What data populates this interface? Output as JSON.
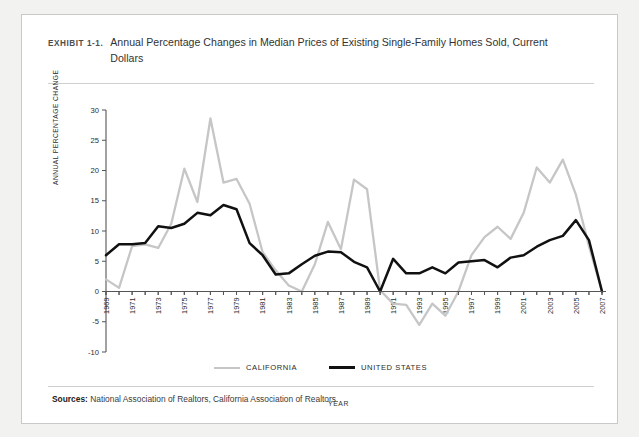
{
  "exhibit": {
    "label": "EXHIBIT 1-1.",
    "title": "Annual Percentage Changes in Median Prices of Existing Single-Family Homes Sold, Current Dollars"
  },
  "sources": {
    "prefix": "Sources:",
    "text": " National Association of Realtors, California Association of Realtors."
  },
  "colors": {
    "california": "#c6c6c6",
    "united_states": "#111111",
    "axis": "#555555",
    "card_border": "#c9c9c7",
    "page_background": "#f2f2f1",
    "card_background": "#ffffff"
  },
  "legend": [
    {
      "label": "CALIFORNIA",
      "series": "California",
      "color": "#c6c6c6"
    },
    {
      "label": "UNITED STATES",
      "series": "United States",
      "color": "#111111"
    }
  ],
  "chart_data": {
    "type": "line",
    "title": "Annual Percentage Changes in Median Prices of Existing Single-Family Homes Sold, Current Dollars",
    "xlabel": "YEAR",
    "ylabel": "ANNUAL PERCENTAGE CHANGE",
    "xlim": [
      1969,
      2007
    ],
    "ylim": [
      -10,
      30
    ],
    "ytick_step": 5,
    "yticks": [
      30,
      25,
      20,
      15,
      10,
      5,
      0,
      -5,
      -10
    ],
    "xticks_all": [
      1969,
      1970,
      1971,
      1972,
      1973,
      1974,
      1975,
      1976,
      1977,
      1978,
      1979,
      1980,
      1981,
      1982,
      1983,
      1984,
      1985,
      1986,
      1987,
      1988,
      1989,
      1990,
      1991,
      1992,
      1993,
      1994,
      1995,
      1996,
      1997,
      1998,
      1999,
      2000,
      2001,
      2002,
      2003,
      2004,
      2005,
      2006,
      2007
    ],
    "xtick_labels": [
      1969,
      1971,
      1973,
      1975,
      1977,
      1979,
      1981,
      1983,
      1985,
      1987,
      1989,
      1991,
      1993,
      1995,
      1997,
      1999,
      2001,
      2003,
      2005,
      2007
    ],
    "grid": false,
    "legend_position": "bottom-center",
    "x": [
      1969,
      1970,
      1971,
      1972,
      1973,
      1974,
      1975,
      1976,
      1977,
      1978,
      1979,
      1980,
      1981,
      1982,
      1983,
      1984,
      1985,
      1986,
      1987,
      1988,
      1989,
      1990,
      1991,
      1992,
      1993,
      1994,
      1995,
      1996,
      1997,
      1998,
      1999,
      2000,
      2001,
      2002,
      2003,
      2004,
      2005,
      2006,
      2007
    ],
    "series": [
      {
        "name": "California",
        "color": "#c6c6c6",
        "values": [
          2.0,
          0.6,
          7.5,
          7.8,
          7.2,
          11.2,
          20.3,
          14.8,
          28.6,
          18.0,
          18.6,
          14.5,
          6.5,
          3.5,
          1.0,
          0.0,
          4.5,
          11.5,
          7.0,
          18.5,
          16.9,
          0.2,
          -2.0,
          -2.2,
          -5.5,
          -2.0,
          -4.0,
          0.0,
          6.0,
          9.0,
          10.7,
          8.7,
          13.0,
          20.5,
          18.0,
          21.8,
          16.0,
          7.5,
          0.0
        ]
      },
      {
        "name": "United States",
        "color": "#111111",
        "values": [
          6.0,
          7.8,
          7.8,
          8.0,
          10.8,
          10.5,
          11.2,
          13.0,
          12.6,
          14.3,
          13.6,
          8.0,
          6.0,
          2.8,
          3.0,
          4.5,
          5.9,
          6.6,
          6.5,
          4.9,
          4.0,
          0.0,
          5.4,
          3.0,
          3.0,
          4.0,
          3.0,
          4.8,
          5.0,
          5.2,
          4.0,
          5.6,
          6.0,
          7.4,
          8.5,
          9.2,
          11.8,
          8.5,
          0.0
        ]
      }
    ]
  }
}
